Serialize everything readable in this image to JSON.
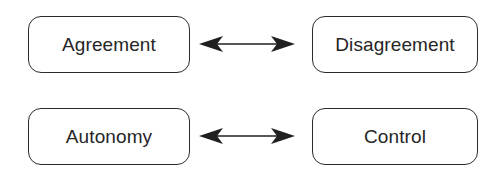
{
  "diagram": {
    "type": "two-row-bidirectional-contrast-diagram",
    "background_color": "#ffffff",
    "node_border_color": "#2b2b2b",
    "text_color": "#262626",
    "arrow_color": "#1f1f1f",
    "rows": [
      {
        "row_index": 1,
        "left_node": {
          "label": "Agreement"
        },
        "connector": {
          "kind": "double-headed-arrow",
          "label": ""
        },
        "right_node": {
          "label": "Disagreement"
        }
      },
      {
        "row_index": 2,
        "left_node": {
          "label": "Autonomy"
        },
        "connector": {
          "kind": "double-headed-arrow",
          "label": ""
        },
        "right_node": {
          "label": "Control"
        }
      }
    ]
  }
}
